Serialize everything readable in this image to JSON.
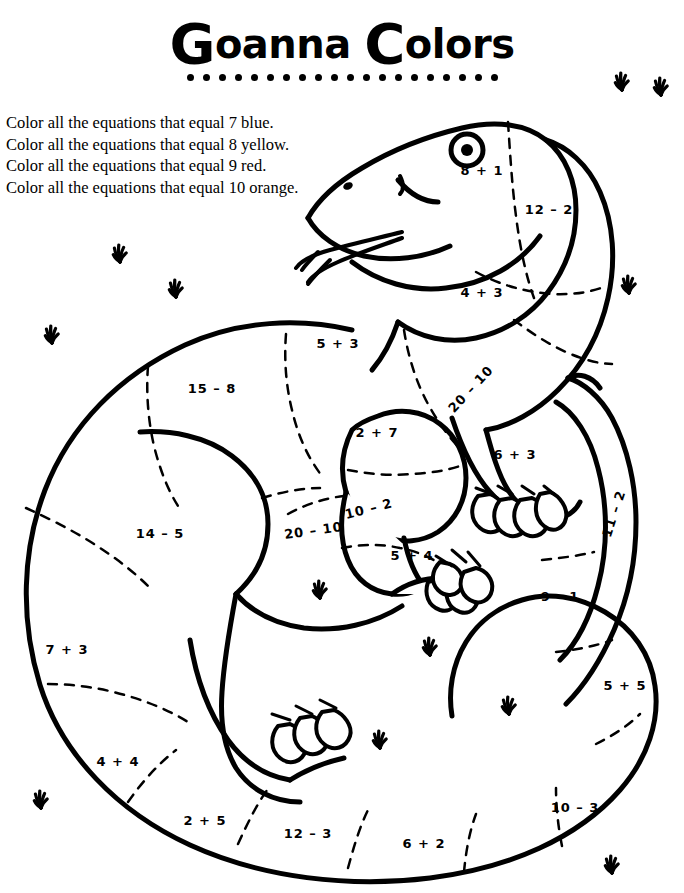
{
  "title": {
    "cap1": "G",
    "word1_rest": "oanna",
    "cap2": "C",
    "word2_rest": "olors",
    "full": "Goanna Colors",
    "dot_count": 20
  },
  "instructions": [
    "Color all the equations that equal 7 blue.",
    "Color all the equations that equal 8 yellow.",
    "Color all the equations that equal 9 red.",
    "Color all the equations that equal 10 orange."
  ],
  "color_key": [
    {
      "sum": 7,
      "color_name": "blue",
      "hex": "#1f5fd0"
    },
    {
      "sum": 8,
      "color_name": "yellow",
      "hex": "#f2d021"
    },
    {
      "sum": 9,
      "color_name": "red",
      "hex": "#d42026"
    },
    {
      "sum": 10,
      "color_name": "orange",
      "hex": "#f08a1d"
    }
  ],
  "artwork": {
    "subject": "goanna",
    "line_color": "#000000",
    "fill_color": "#ffffff",
    "background": "#ffffff",
    "divider_style": "dashed"
  },
  "equations": [
    {
      "id": "head-cheek",
      "text": "8 + 1",
      "x": 482,
      "y": 175,
      "rotate": 0,
      "answer": 9
    },
    {
      "id": "neck-upper",
      "text": "12 – 2",
      "x": 549,
      "y": 214,
      "rotate": 0,
      "answer": 10
    },
    {
      "id": "neck-lower",
      "text": "4 + 3",
      "x": 482,
      "y": 297,
      "rotate": 0,
      "answer": 7
    },
    {
      "id": "back-mid",
      "text": "5 + 3",
      "x": 338,
      "y": 348,
      "rotate": 0,
      "answer": 8
    },
    {
      "id": "back-left",
      "text": "15 – 8",
      "x": 212,
      "y": 393,
      "rotate": 0,
      "answer": 7
    },
    {
      "id": "shoulder",
      "text": "20 – 10",
      "x": 474,
      "y": 392,
      "rotate": -47,
      "answer": 10
    },
    {
      "id": "foreleg-up",
      "text": "2 + 7",
      "x": 377,
      "y": 437,
      "rotate": 0,
      "answer": 9
    },
    {
      "id": "foreleg-low",
      "text": "10 – 2",
      "x": 370,
      "y": 513,
      "rotate": -14,
      "answer": 8
    },
    {
      "id": "right-arm",
      "text": "6 + 3",
      "x": 515,
      "y": 459,
      "rotate": 0,
      "answer": 9
    },
    {
      "id": "belly-left",
      "text": "14 – 5",
      "x": 160,
      "y": 538,
      "rotate": 0,
      "answer": 9
    },
    {
      "id": "chest",
      "text": "20 – 10",
      "x": 314,
      "y": 535,
      "rotate": -8,
      "answer": 10
    },
    {
      "id": "front-foot",
      "text": "5 + 4",
      "x": 412,
      "y": 560,
      "rotate": 0,
      "answer": 9
    },
    {
      "id": "tail-upper",
      "text": "11 – 2",
      "x": 618,
      "y": 515,
      "rotate": -72,
      "answer": 9
    },
    {
      "id": "tail-mid",
      "text": "9 – 1",
      "x": 560,
      "y": 601,
      "rotate": 0,
      "answer": 8
    },
    {
      "id": "tail-lower",
      "text": "5 + 5",
      "x": 625,
      "y": 690,
      "rotate": 0,
      "answer": 10
    },
    {
      "id": "flank-left",
      "text": "7 + 3",
      "x": 67,
      "y": 654,
      "rotate": 0,
      "answer": 10
    },
    {
      "id": "belly-bot-l",
      "text": "4 + 4",
      "x": 118,
      "y": 766,
      "rotate": 0,
      "answer": 8
    },
    {
      "id": "belly-bot-2",
      "text": "2 + 5",
      "x": 205,
      "y": 825,
      "rotate": 0,
      "answer": 7
    },
    {
      "id": "belly-bot-3",
      "text": "12 – 3",
      "x": 308,
      "y": 838,
      "rotate": 0,
      "answer": 9
    },
    {
      "id": "belly-bot-4",
      "text": "6 + 2",
      "x": 424,
      "y": 848,
      "rotate": 0,
      "answer": 8
    },
    {
      "id": "tail-bot",
      "text": "10 – 3",
      "x": 575,
      "y": 812,
      "rotate": 0,
      "answer": 7
    }
  ],
  "grass_tufts": [
    {
      "x": 120,
      "y": 262
    },
    {
      "x": 176,
      "y": 297
    },
    {
      "x": 52,
      "y": 343
    },
    {
      "x": 629,
      "y": 293
    },
    {
      "x": 622,
      "y": 90
    },
    {
      "x": 661,
      "y": 95
    },
    {
      "x": 320,
      "y": 598
    },
    {
      "x": 430,
      "y": 655
    },
    {
      "x": 509,
      "y": 714
    },
    {
      "x": 380,
      "y": 748
    },
    {
      "x": 41,
      "y": 808
    },
    {
      "x": 612,
      "y": 873
    }
  ]
}
